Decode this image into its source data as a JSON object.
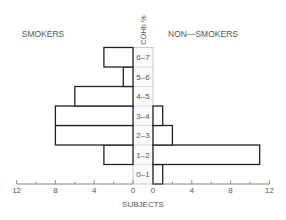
{
  "chart_data": {
    "type": "bar",
    "orientation": "horizontal-back-to-back",
    "title": "",
    "categories_label": "COHb %",
    "categories": [
      "0-1",
      "1-2",
      "2-3",
      "3-4",
      "4-5",
      "5-6",
      "6-7"
    ],
    "category_display": [
      "0–1",
      "1–2",
      "2–3",
      "3–4",
      "4–5",
      "5–6",
      "6–7"
    ],
    "series": [
      {
        "name": "SMOKERS",
        "side": "left",
        "values": [
          0,
          3,
          8,
          8,
          6,
          1,
          3
        ]
      },
      {
        "name": "NON—SMOKERS",
        "side": "right",
        "values": [
          1,
          11,
          2,
          1,
          0,
          0,
          0
        ]
      }
    ],
    "xlabel": "SUBJECTS",
    "xlim": [
      0,
      12
    ],
    "xticks_left": [
      "12",
      "8",
      "4",
      "0"
    ],
    "xticks_right": [
      "0",
      "4",
      "8",
      "12"
    ],
    "minor_tick_step": 2,
    "grid": false
  },
  "labels": {
    "left_group": "SMOKERS",
    "right_group": "NON—SMOKERS",
    "center_axis": "COHb %",
    "x_axis": "SUBJECTS"
  }
}
